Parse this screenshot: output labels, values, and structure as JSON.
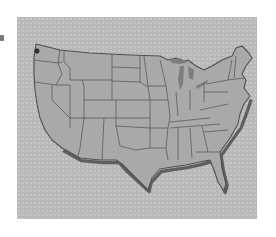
{
  "figure": {
    "type": "map",
    "style": "grayscale halftone, drop shadow along southern and eastern coast",
    "colors": {
      "page_background": "#ffffff",
      "panel_background": "#b9b9b9",
      "land_fill": "#a9a9a9",
      "border_stroke": "#555555",
      "coast_shadow": "#6a6a6a"
    },
    "marker": {
      "label": "",
      "location": "northwest Washington (Puget Sound area)",
      "icon": "small-circle-marker"
    }
  }
}
